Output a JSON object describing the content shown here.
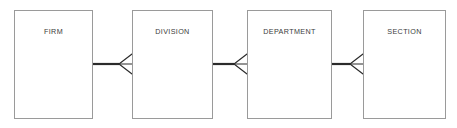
{
  "diagram": {
    "type": "entity-relationship-diagram",
    "notation": "crows-foot",
    "canvas": {
      "width": 457,
      "height": 128,
      "background": "#ffffff"
    },
    "style": {
      "box_border_color": "#9a9a9a",
      "box_fill_color": "#ffffff",
      "label_color": "#3b3b3b",
      "connector_color": "#2b2b2b"
    },
    "entities": [
      {
        "id": "firm",
        "label": "FIRM",
        "x": 14,
        "y": 10,
        "width": 79,
        "height": 109,
        "label_y": 17
      },
      {
        "id": "division",
        "label": "DIVISION",
        "x": 132,
        "y": 10,
        "width": 81,
        "height": 109,
        "label_y": 17
      },
      {
        "id": "department",
        "label": "DEPARTMENT",
        "x": 247,
        "y": 10,
        "width": 85,
        "height": 109,
        "label_y": 17
      },
      {
        "id": "section",
        "label": "SECTION",
        "x": 363,
        "y": 10,
        "width": 83,
        "height": 109,
        "label_y": 17
      }
    ],
    "relationships": [
      {
        "id": "firm-division",
        "from": "firm",
        "to": "division",
        "from_label": "FIRM",
        "to_label": "DIVISION",
        "from_cardinality": "one",
        "to_cardinality": "many",
        "line_y": 64,
        "line_x1": 93,
        "line_x2": 119,
        "foot_apex_x": 119,
        "foot_end_x": 132,
        "foot_spread": 10
      },
      {
        "id": "division-department",
        "from": "division",
        "to": "department",
        "from_label": "DIVISION",
        "to_label": "DEPARTMENT",
        "from_cardinality": "one",
        "to_cardinality": "many",
        "line_y": 64,
        "line_x1": 213,
        "line_x2": 234,
        "foot_apex_x": 234,
        "foot_end_x": 247,
        "foot_spread": 10
      },
      {
        "id": "department-section",
        "from": "department",
        "to": "section",
        "from_label": "DEPARTMENT",
        "to_label": "SECTION",
        "from_cardinality": "one",
        "to_cardinality": "many",
        "line_y": 64,
        "line_x1": 332,
        "line_x2": 350,
        "foot_apex_x": 350,
        "foot_end_x": 363,
        "foot_spread": 10
      }
    ]
  }
}
